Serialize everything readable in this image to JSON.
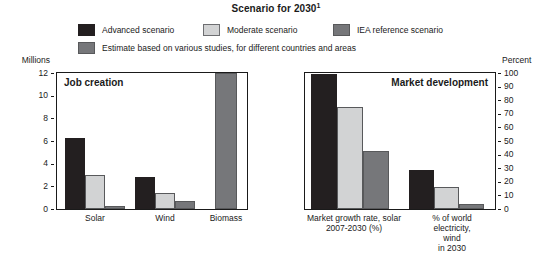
{
  "title": {
    "text": "Scenario for 2030",
    "superscript": "1"
  },
  "legend": {
    "items": [
      {
        "label": "Advanced scenario",
        "color": "#231f20",
        "border": "#231f20"
      },
      {
        "label": "Moderate scenario",
        "color": "#d2d3d4",
        "border": "#6d6e71"
      },
      {
        "label": "IEA reference scenario",
        "color": "#76777a",
        "border": "#58595b"
      },
      {
        "label": "Estimate based on various studies, for different countries and areas",
        "color": "#76777a",
        "border": "#58595b"
      }
    ]
  },
  "panels": {
    "left": {
      "title": "Job creation",
      "axis_unit": "Millions",
      "ticks": [
        "12",
        "10",
        "8",
        "6",
        "4",
        "2",
        "0"
      ]
    },
    "right": {
      "title": "Market development",
      "axis_unit": "Percent",
      "ticks": [
        "100",
        "90",
        "80",
        "70",
        "60",
        "50",
        "40",
        "30",
        "20",
        "10",
        "0"
      ]
    }
  },
  "chart_data": [
    {
      "type": "bar",
      "title": "Job creation",
      "subtitle": "Scenario for 2030",
      "ylabel": "Millions",
      "xlabel": "",
      "ylim": [
        0,
        12
      ],
      "yticks": [
        0,
        2,
        4,
        6,
        8,
        10,
        12
      ],
      "grid": false,
      "legend_position": "top",
      "categories": [
        "Solar",
        "Wind",
        "Biomass"
      ],
      "series": [
        {
          "name": "Advanced scenario",
          "color": "#231f20",
          "values": [
            6.3,
            2.85,
            null
          ]
        },
        {
          "name": "Moderate scenario",
          "color": "#d2d3d4",
          "values": [
            3.0,
            1.45,
            null
          ]
        },
        {
          "name": "IEA reference scenario",
          "color": "#76777a",
          "values": [
            0.3,
            0.7,
            null
          ]
        },
        {
          "name": "Estimate based on various studies, for different countries and areas",
          "color": "#76777a",
          "values": [
            null,
            null,
            12.0
          ]
        }
      ]
    },
    {
      "type": "bar",
      "title": "Market development",
      "subtitle": "Scenario for 2030",
      "ylabel": "Percent",
      "xlabel": "",
      "ylim": [
        0,
        100
      ],
      "yticks": [
        0,
        10,
        20,
        30,
        40,
        50,
        60,
        70,
        80,
        90,
        100
      ],
      "grid": false,
      "legend_position": "top",
      "categories": [
        "Market growth rate, solar 2007-2030 (%)",
        "% of world electricity, wind in 2030"
      ],
      "series": [
        {
          "name": "Advanced scenario",
          "color": "#231f20",
          "values": [
            99,
            29
          ]
        },
        {
          "name": "Moderate scenario",
          "color": "#d2d3d4",
          "values": [
            75,
            16
          ]
        },
        {
          "name": "IEA reference scenario",
          "color": "#76777a",
          "values": [
            43,
            4
          ]
        }
      ]
    }
  ],
  "categories": {
    "left": [
      {
        "line1": "Solar",
        "line2": ""
      },
      {
        "line1": "Wind",
        "line2": ""
      },
      {
        "line1": "Biomass",
        "line2": ""
      }
    ],
    "right": [
      {
        "line1": "Market growth rate, solar",
        "line2": "2007-2030 (%)"
      },
      {
        "line1": "% of world electricity, wind",
        "line2": "in 2030"
      }
    ]
  }
}
